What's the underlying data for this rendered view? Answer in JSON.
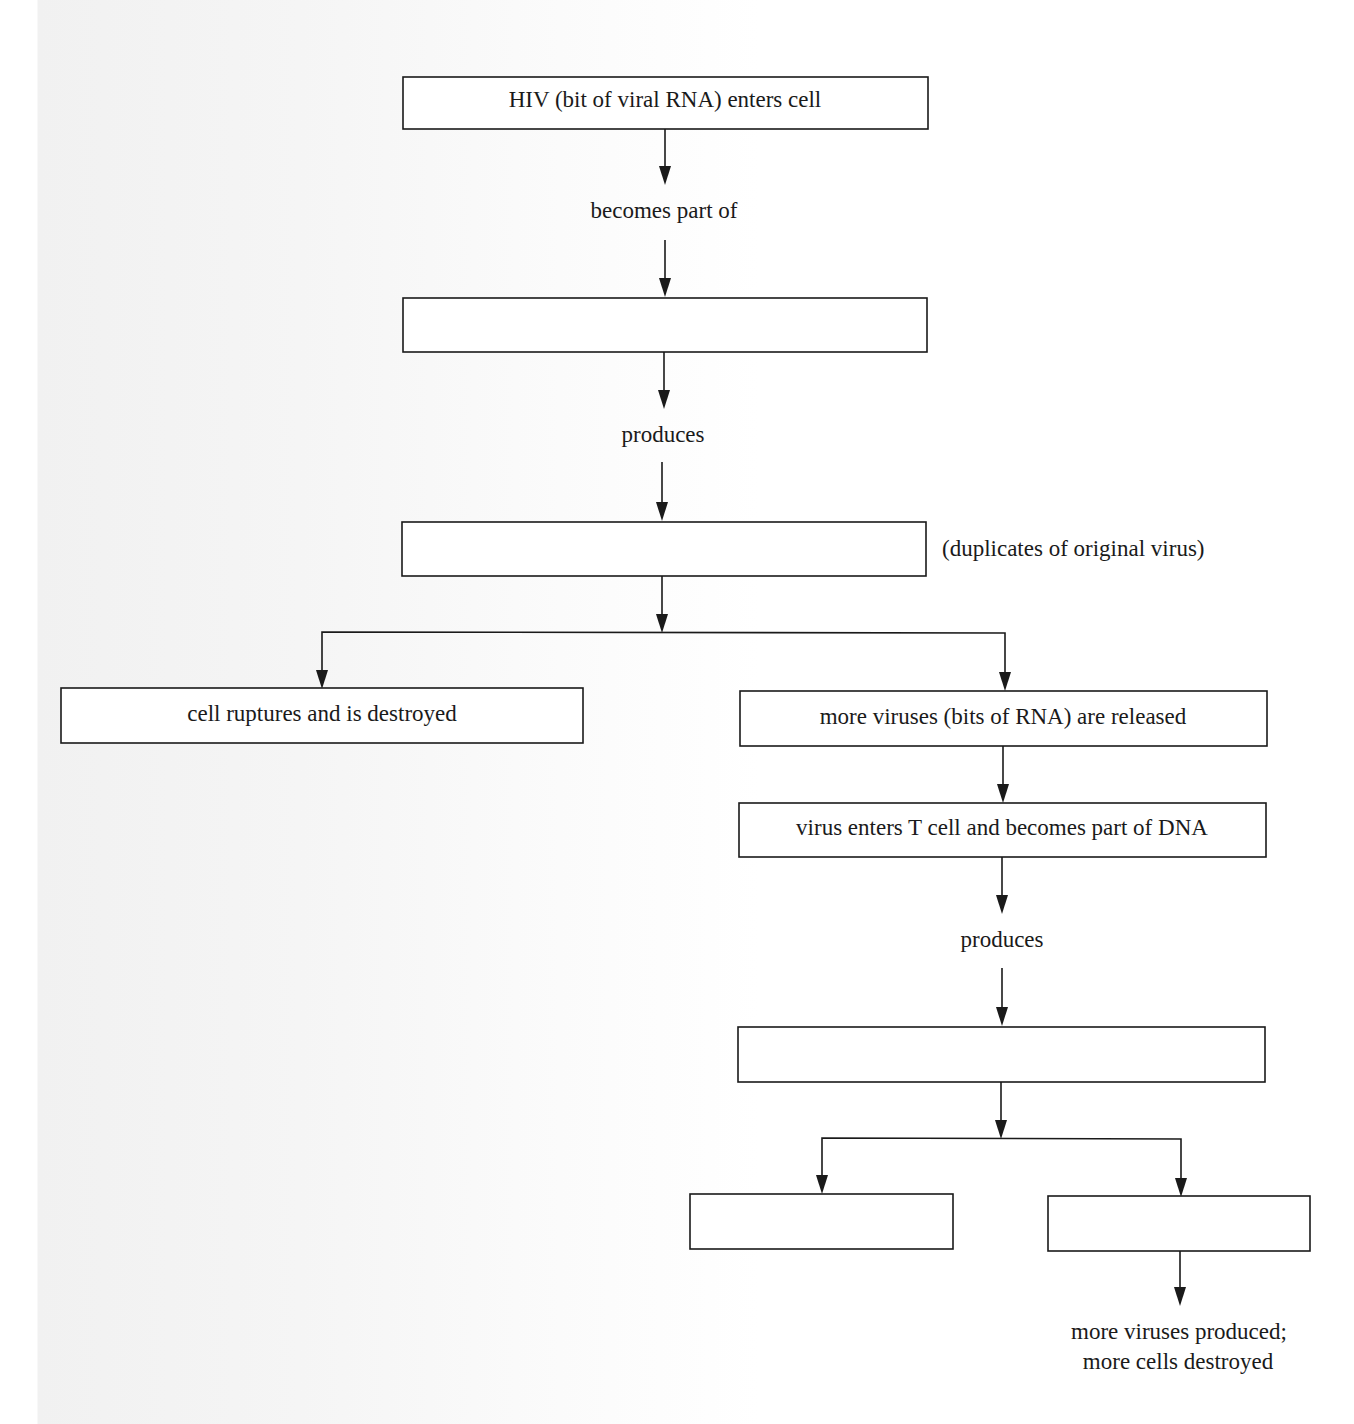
{
  "diagram": {
    "nodes": {
      "hiv_enters": "HIV (bit of viral RNA) enters cell",
      "blank_1": "",
      "blank_2": "",
      "cell_ruptures": "cell ruptures and is destroyed",
      "more_viruses_released": "more viruses (bits of RNA) are released",
      "virus_enters_t_cell": "virus enters T cell and becomes part of DNA",
      "blank_3": "",
      "blank_4": "",
      "blank_5": ""
    },
    "edge_labels": {
      "becomes_part_of": "becomes part of",
      "produces_1": "produces",
      "produces_2": "produces"
    },
    "annotations": {
      "duplicates_note": "(duplicates of original virus)",
      "final_line_1": "more viruses produced;",
      "final_line_2": "more cells destroyed"
    },
    "colors": {
      "stroke": "#1a1a1a",
      "box_fill": "#ffffff",
      "background": "#ffffff"
    }
  }
}
